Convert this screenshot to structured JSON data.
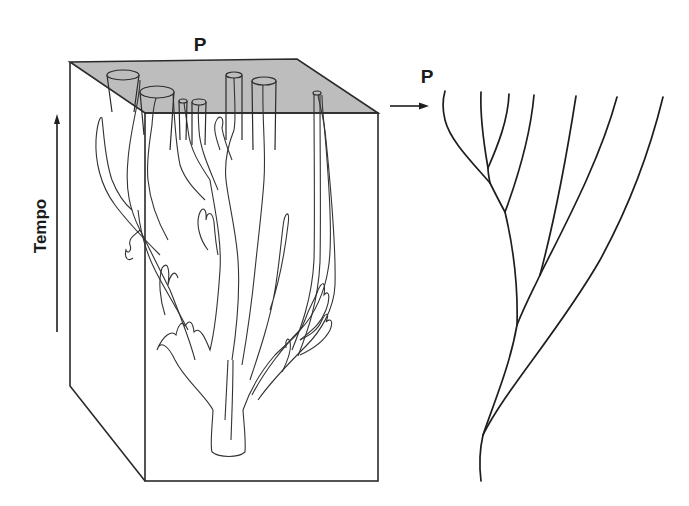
{
  "figure": {
    "type": "diagram",
    "colors": {
      "top_face": "#bdbdbd",
      "lines": "#1e1e1e",
      "background": "#ffffff"
    }
  },
  "block": {
    "top_label": "P",
    "time_axis_label": "Tempo"
  },
  "projection": {
    "label": "P",
    "arrow": "right-arrow"
  },
  "tree": {
    "tips": 7,
    "root": "bottom"
  }
}
